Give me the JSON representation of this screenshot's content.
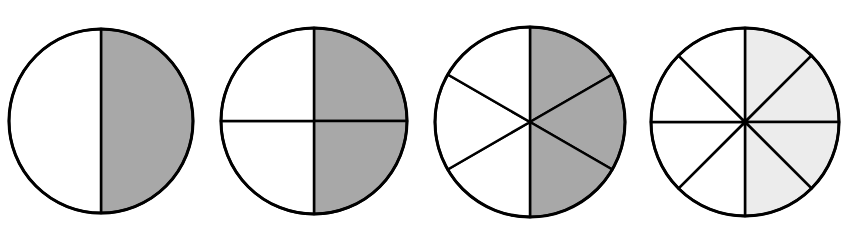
{
  "diagram": {
    "colors": {
      "outline": "#000000",
      "background": "#ffffff",
      "shade_dark": "#a8a8a8",
      "shade_light": "#ececec",
      "unshaded": "#ffffff"
    },
    "circles": [
      {
        "id": "halves",
        "cx": 101,
        "cy": 121,
        "r": 92,
        "divisions": 2,
        "shaded": 1,
        "shade": "shade_dark",
        "fraction": "1/2"
      },
      {
        "id": "quarters",
        "cx": 314,
        "cy": 121,
        "r": 93,
        "divisions": 4,
        "shaded": 2,
        "shade": "shade_dark",
        "fraction": "2/4"
      },
      {
        "id": "sixths",
        "cx": 530,
        "cy": 122,
        "r": 95,
        "divisions": 6,
        "shaded": 3,
        "shade": "shade_dark",
        "fraction": "3/6"
      },
      {
        "id": "eighths",
        "cx": 745,
        "cy": 122,
        "r": 94,
        "divisions": 8,
        "shaded": 4,
        "shade": "shade_light",
        "fraction": "4/8"
      }
    ]
  }
}
